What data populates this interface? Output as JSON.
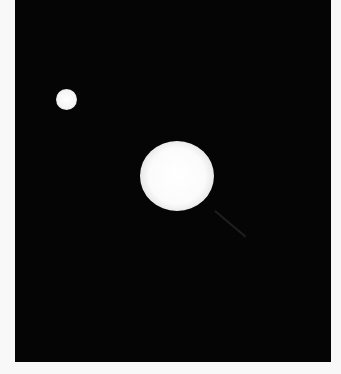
{
  "image": {
    "description": "Astronomical photograph of a bright star with a smaller companion star on a black sky background",
    "background_color": "#050505",
    "border_color": "#f8f8f8",
    "objects": [
      {
        "name": "companion-star",
        "center": [
          66,
          99
        ],
        "radius": 10,
        "color": "#f4f4f4"
      },
      {
        "name": "primary-star",
        "center": [
          176,
          174
        ],
        "radius": 35,
        "color": "#ffffff"
      }
    ]
  }
}
